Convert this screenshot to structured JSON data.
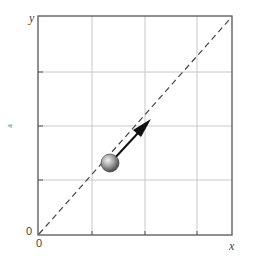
{
  "diagram": {
    "title": "",
    "axes": {
      "x_label": "x",
      "y_label": "y",
      "origin_x_label": "0",
      "origin_y_label": "0",
      "side_mark": "a"
    },
    "grid": {
      "rows": 4,
      "cols": 4
    },
    "dashed_line": {
      "from": "origin",
      "to": "top-right corner",
      "description": "diagonal y = x"
    },
    "ball": {
      "description": "shaded sphere on the diagonal",
      "color": "#8a8a8a"
    },
    "arrow": {
      "description": "velocity arrow pointing up-right along the diagonal",
      "color": "#111111"
    },
    "colors": {
      "frame": "#555555",
      "grid": "#c8c8c8",
      "dashed": "#444444"
    }
  }
}
